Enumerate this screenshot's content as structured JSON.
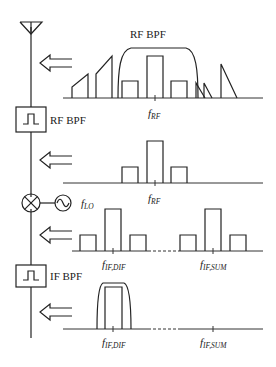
{
  "diagram": {
    "blocks": [
      {
        "id": "antenna",
        "label": ""
      },
      {
        "id": "rf_bpf",
        "label": "RF BPF"
      },
      {
        "id": "mixer",
        "label": ""
      },
      {
        "id": "lo",
        "label": "f",
        "sub": "LO"
      },
      {
        "id": "if_bpf",
        "label": "IF BPF"
      }
    ],
    "spectra": [
      {
        "id": "spectrum-input",
        "filter_label": "RF BPF",
        "freq_labels": [
          {
            "f": "f",
            "sub": "RF"
          }
        ]
      },
      {
        "id": "spectrum-after-rf-bpf",
        "freq_labels": [
          {
            "f": "f",
            "sub": "RF"
          }
        ]
      },
      {
        "id": "spectrum-after-mixer",
        "freq_labels": [
          {
            "f": "f",
            "sub": "IF,DIF"
          },
          {
            "f": "f",
            "sub": "IF,SUM"
          }
        ]
      },
      {
        "id": "spectrum-after-if-bpf",
        "freq_labels": [
          {
            "f": "f",
            "sub": "IF,DIF"
          },
          {
            "f": "f",
            "sub": "IF,SUM"
          }
        ]
      }
    ]
  }
}
